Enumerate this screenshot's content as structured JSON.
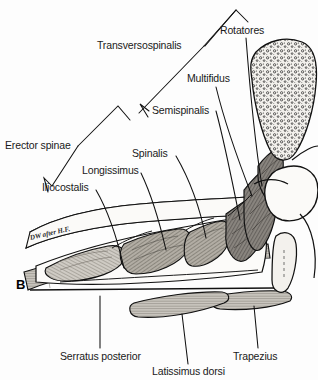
{
  "figure": {
    "panel_letter": "B",
    "artist_credit": "DW after H.F.",
    "type": "anatomical-cross-section"
  },
  "labels": [
    {
      "id": "transversospinalis",
      "text": "Transversospinalis",
      "x": 97,
      "y": 40,
      "connector": "bracket"
    },
    {
      "id": "rotatores",
      "text": "Rotatores",
      "x": 220,
      "y": 25,
      "connector": "line"
    },
    {
      "id": "multifidus",
      "text": "Multifidus",
      "x": 187,
      "y": 73,
      "connector": "line"
    },
    {
      "id": "semispinalis",
      "text": "Semispinalis",
      "x": 152,
      "y": 105,
      "connector": "bracket"
    },
    {
      "id": "erector-spinae",
      "text": "Erector spinae",
      "x": 5,
      "y": 140,
      "connector": "bracket"
    },
    {
      "id": "spinalis",
      "text": "Spinalis",
      "x": 132,
      "y": 148,
      "connector": "line"
    },
    {
      "id": "longissimus",
      "text": "Longissimus",
      "x": 82,
      "y": 165,
      "connector": "line"
    },
    {
      "id": "iliocostalis",
      "text": "Iliocostalis",
      "x": 42,
      "y": 182,
      "connector": "bracket"
    },
    {
      "id": "serratus-posterior",
      "text": "Serratus posterior",
      "x": 60,
      "y": 351,
      "connector": "line"
    },
    {
      "id": "latissimus-dorsi",
      "text": "Latissimus dorsi",
      "x": 152,
      "y": 366,
      "connector": "line"
    },
    {
      "id": "trapezius",
      "text": "Trapezius",
      "x": 233,
      "y": 351,
      "connector": "line"
    }
  ],
  "colors": {
    "ink": "#1a1a1a",
    "outline": "#111111",
    "muscle_light": "#cfcbc4",
    "muscle_mid": "#b5b0a7",
    "muscle_dark": "#8d8981",
    "muscle_deep": "#6f6b63",
    "bone_fill": "#eceae6",
    "background": "#fdfdfd"
  }
}
